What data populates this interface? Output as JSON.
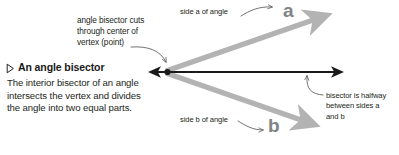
{
  "figure": {
    "title": "An angle bisector",
    "bullet_icon": "triangle-right-outline-icon",
    "definition": "The interior bisector of an angle\nintersects the vertex and divides\nthe angle into two equal parts.",
    "callouts": {
      "vertex": "angle bisector cuts\nthrough center of\nvertex (point)",
      "halfway": "bisector is halfway\nbetween sides a\nand b"
    },
    "labels": {
      "side_a": "side a of angle",
      "side_b": "side b of angle",
      "ray_a": "a",
      "ray_b": "b"
    },
    "colors": {
      "background": "#ffffff",
      "ink": "#231f20",
      "bisector": "#1a1a1a",
      "ray": "#b3b3b3",
      "ray_letter": "#808285",
      "leader": "#58595b"
    },
    "geometry": {
      "vertex": {
        "x": 165,
        "y": 72
      },
      "bisector_end": {
        "x": 342,
        "y": 72
      },
      "ray_a_end": {
        "x": 322,
        "y": 16
      },
      "ray_b_end": {
        "x": 310,
        "y": 124
      }
    }
  }
}
